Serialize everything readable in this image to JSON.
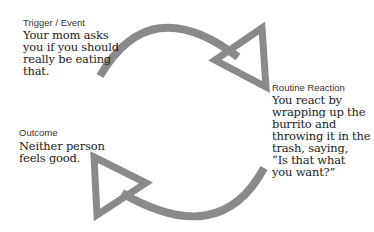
{
  "diagram": {
    "type": "cycle",
    "arrow_color": "#8a8a8a",
    "nodes": [
      {
        "id": "trigger",
        "label": "Trigger / Event",
        "text": "Your mom asks you if you should really be eating that.",
        "lines": [
          "Your mom asks",
          "you if you should",
          "really be eating",
          "that."
        ]
      },
      {
        "id": "routine",
        "label": "Routine Reaction",
        "text": "You react by wrapping up the burrito and throwing it in the trash, saying, “Is that what you want?”",
        "lines": [
          "You react by",
          "wrapping up the",
          "burrito and",
          "throwing it in the",
          "trash, saying,",
          "“Is that what",
          "you want?”"
        ]
      },
      {
        "id": "outcome",
        "label": "Outcome",
        "text": "Neither person feels good.",
        "lines": [
          "Neither person",
          "feels good."
        ]
      }
    ],
    "edges": [
      {
        "from": "trigger",
        "to": "routine"
      },
      {
        "from": "routine",
        "to": "outcome"
      }
    ]
  }
}
